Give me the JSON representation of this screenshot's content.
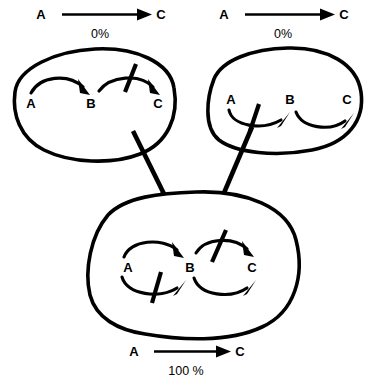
{
  "figure": {
    "name": "three-state-signalling-diagram",
    "background_color": "#ffffff",
    "ink_color": "#000000"
  },
  "panels": [
    {
      "id": "top-left",
      "header": {
        "from_label": "A",
        "to_label": "C",
        "percent_label": "0%"
      },
      "nodes": [
        {
          "id": "A",
          "label": "A"
        },
        {
          "id": "B",
          "label": "B"
        },
        {
          "id": "C",
          "label": "C"
        }
      ],
      "edges": [
        {
          "from": "A",
          "to": "B",
          "direction": "above",
          "inhibited": false
        },
        {
          "from": "B",
          "to": "C",
          "direction": "above",
          "inhibited": true
        }
      ]
    },
    {
      "id": "top-right",
      "header": {
        "from_label": "A",
        "to_label": "C",
        "percent_label": "0%"
      },
      "nodes": [
        {
          "id": "A",
          "label": "A"
        },
        {
          "id": "B",
          "label": "B"
        },
        {
          "id": "C",
          "label": "C"
        }
      ],
      "edges": [
        {
          "from": "A",
          "to": "B",
          "direction": "below",
          "inhibited": true
        },
        {
          "from": "B",
          "to": "C",
          "direction": "below",
          "inhibited": false
        }
      ]
    },
    {
      "id": "bottom",
      "header": {
        "from_label": "A",
        "to_label": "C",
        "percent_label": "100 %"
      },
      "nodes": [
        {
          "id": "A",
          "label": "A"
        },
        {
          "id": "B",
          "label": "B"
        },
        {
          "id": "C",
          "label": "C"
        }
      ],
      "edges": [
        {
          "from": "A",
          "to": "B",
          "direction": "above",
          "inhibited": false
        },
        {
          "from": "A",
          "to": "B",
          "direction": "below",
          "inhibited": true
        },
        {
          "from": "B",
          "to": "C",
          "direction": "above",
          "inhibited": true
        },
        {
          "from": "B",
          "to": "C",
          "direction": "below",
          "inhibited": false
        }
      ]
    }
  ],
  "connectors": [
    {
      "id": "left-connector",
      "from_panel": "top-left",
      "to_panel": "bottom"
    },
    {
      "id": "right-connector",
      "from_panel": "top-right",
      "to_panel": "bottom"
    }
  ]
}
